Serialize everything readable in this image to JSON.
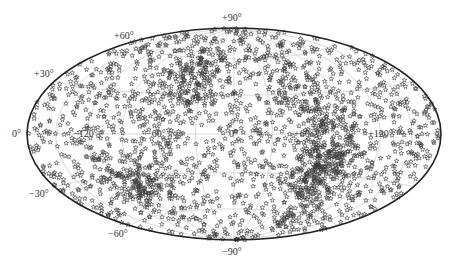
{
  "chart_data": {
    "type": "scatter",
    "projection": "hammer-aitoff",
    "title": "",
    "xlabel": "",
    "ylabel": "",
    "marker": "star",
    "marker_color": "#3a3a3a",
    "grid": true,
    "grid_color": "#c8c8c8",
    "frame_color": "#222222",
    "longitude_ticks": [
      -120,
      -60,
      0,
      60,
      120
    ],
    "latitude_ticks": [
      -90,
      -60,
      -30,
      0,
      30,
      60,
      90
    ],
    "longitude_labels": [
      "−120°",
      "−60°",
      "0°",
      "+60°",
      "+120°"
    ],
    "latitude_labels": {
      "p90": "+90°",
      "p60": "+60°",
      "p30": "+30°",
      "z0": "0°",
      "m30": "−30°",
      "m60": "−60°",
      "m90": "−90°"
    },
    "xlim": [
      -180,
      180
    ],
    "ylim": [
      -90,
      90
    ],
    "approx_point_count": 2200,
    "density_features": [
      {
        "description": "dense arc / band",
        "lon_range": [
          50,
          100
        ],
        "lat_range": [
          -60,
          60
        ]
      },
      {
        "description": "dense cluster",
        "lon_range": [
          60,
          90
        ],
        "lat_range": [
          -45,
          -10
        ]
      },
      {
        "description": "dense cluster",
        "lon_range": [
          -120,
          -70
        ],
        "lat_range": [
          -50,
          -20
        ]
      },
      {
        "description": "dense cluster",
        "lon_range": [
          -70,
          -20
        ],
        "lat_range": [
          20,
          60
        ]
      }
    ]
  },
  "layout": {
    "cx": 234,
    "cy": 134,
    "a": 207,
    "b": 106
  }
}
